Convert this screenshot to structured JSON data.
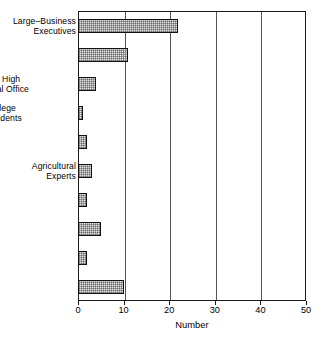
{
  "chart_data": {
    "type": "bar",
    "orientation": "horizontal",
    "title": "",
    "xlabel": "Number",
    "ylabel": "",
    "xlim": [
      0,
      50
    ],
    "xticks": [
      0,
      10,
      20,
      30,
      40,
      50
    ],
    "grid": true,
    "grid_axis": "x",
    "legend": false,
    "categories": [
      "Large–Business\nExecutives",
      "Business\nLawyers",
      "Won  High\nPolitical Office",
      "College\nPresidents",
      "Military Leaders",
      "Agricultural\nExperts",
      "Labor Experts",
      "Publicists",
      "Women",
      "Number aged\nless than 45"
    ],
    "values": [
      22,
      11,
      4,
      1,
      2,
      3,
      2,
      5,
      2,
      10
    ],
    "bar_fill": "#e2e2e2",
    "bar_edge": "#111111",
    "axis_color": "#1a1a1a"
  },
  "axis": {
    "tick_labels": [
      "0",
      "10",
      "20",
      "30",
      "40",
      "50"
    ],
    "title": "Number"
  },
  "rows": [
    {
      "label": "Large–Business\nExecutives",
      "value": 22,
      "align": "right"
    },
    {
      "label": "Business\nLawyers",
      "value": 11,
      "align": "left"
    },
    {
      "label": "Won  High\nPolitical Office",
      "value": 4,
      "align": "center"
    },
    {
      "label": "College\nPresidents",
      "value": 1,
      "align": "center"
    },
    {
      "label": "Military Leaders",
      "value": 2,
      "align": "left"
    },
    {
      "label": "Agricultural\nExperts",
      "value": 3,
      "align": "right"
    },
    {
      "label": "Labor Experts",
      "value": 2,
      "align": "left"
    },
    {
      "label": "Publicists",
      "value": 5,
      "align": "left"
    },
    {
      "label": "Women",
      "value": 2,
      "align": "left"
    },
    {
      "label": "Number aged\nless than 45",
      "value": 10,
      "align": "left"
    }
  ]
}
